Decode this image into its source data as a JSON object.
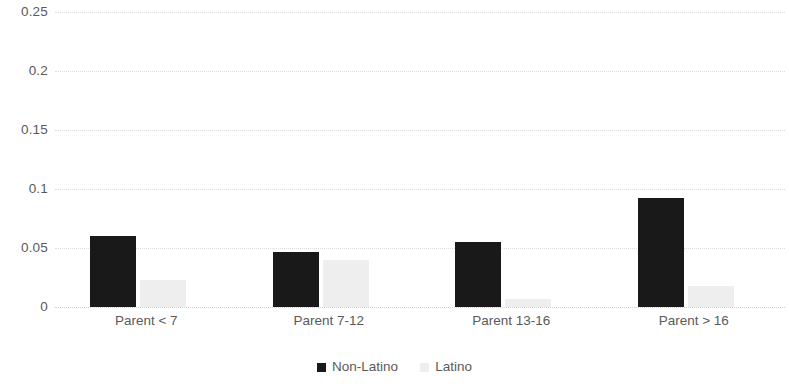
{
  "chart_data": {
    "type": "bar",
    "title": "",
    "subtitle": "",
    "xlabel": "",
    "ylabel": "",
    "categories": [
      "Parent < 7",
      "Parent 7-12",
      "Parent 13-16",
      "Parent > 16"
    ],
    "series": [
      {
        "name": "Non-Latino",
        "color": "#191919",
        "values": [
          0.06,
          0.047,
          0.055,
          0.092
        ]
      },
      {
        "name": "Latino",
        "color": "#eeeeee",
        "values": [
          0.023,
          0.04,
          0.007,
          0.018
        ]
      }
    ],
    "ylim": [
      0,
      0.25
    ],
    "yticks": [
      0,
      0.05,
      0.1,
      0.15,
      0.2,
      0.25
    ],
    "ytick_labels": [
      "0",
      "0.05",
      "0.1",
      "0.15",
      "0.2",
      "0.25"
    ],
    "grid": true,
    "grid_axis": "y",
    "legend_position": "bottom",
    "legend_entries": [
      "Non-Latino",
      "Latino"
    ]
  },
  "colors": {
    "series_0": "#191919",
    "series_1": "#eeeeee",
    "gridline": "#dcdcdc",
    "text": "#5a5a5a",
    "background": "#ffffff"
  }
}
